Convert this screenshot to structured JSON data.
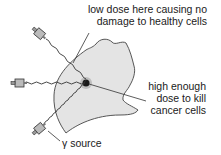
{
  "diagram": {
    "labels": {
      "low_dose_line1": "low dose here causing no",
      "low_dose_line2": "damage to healthy cells",
      "high_dose_line1": "high enough",
      "high_dose_line2": "dose to kill",
      "high_dose_line3": "cancer cells",
      "source": "γ source"
    },
    "colors": {
      "head_fill": "#e4e4e4",
      "outline": "#444444",
      "tumour": "#1a1a1a",
      "text": "#1a1a1a"
    },
    "sources": [
      {
        "name": "top-left",
        "position": "upper-left, aimed down-right"
      },
      {
        "name": "left",
        "position": "left, aimed right"
      },
      {
        "name": "bottom-left",
        "position": "lower-left, aimed up-right"
      }
    ]
  }
}
